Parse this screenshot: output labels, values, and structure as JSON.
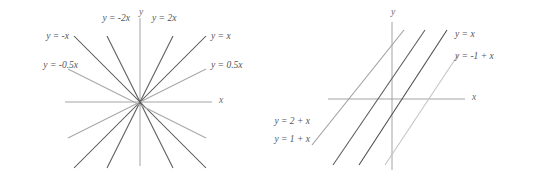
{
  "figure": {
    "background_color": "#ffffff",
    "width": 535,
    "height": 177
  },
  "chart_data": [
    {
      "type": "line",
      "title": "",
      "subtitle": "",
      "xlabel": "x",
      "ylabel": "y",
      "grid": false,
      "legend_position": "inline-annotations",
      "axis_color": "#9a9a9a",
      "origin": {
        "x": 140,
        "y": 102
      },
      "scale": {
        "x_units_per_px": 1,
        "y_units_per_px": 1
      },
      "xlim": [
        -75,
        72
      ],
      "ylim": [
        -66,
        84
      ],
      "axes": {
        "x_axis": {
          "x1": 65,
          "y1": 102,
          "x2": 212,
          "y2": 102
        },
        "y_axis": {
          "x1": 140,
          "y1": 18,
          "x2": 140,
          "y2": 166
        }
      },
      "axis_label_positions": {
        "x": {
          "x": 219,
          "y": 101
        },
        "y": {
          "x": 141,
          "y": 13
        }
      },
      "series": [
        {
          "name": "y = 2x",
          "label": "y = 2x",
          "slope": 2,
          "intercept": 0,
          "color": "#5f5f5f",
          "x1": 107,
          "y1": 168,
          "x2": 173,
          "y2": 36,
          "label_x": 152,
          "label_y": 19,
          "label_anchor": "start"
        },
        {
          "name": "y = x",
          "label": "y = x",
          "slope": 1,
          "intercept": 0,
          "color": "#4f4f4f",
          "x1": 74,
          "y1": 168,
          "x2": 206,
          "y2": 36,
          "label_x": 211,
          "label_y": 37,
          "label_anchor": "start"
        },
        {
          "name": "y = 0.5x",
          "label": "y = 0.5x",
          "slope": 0.5,
          "intercept": 0,
          "color": "#a8a8a8",
          "x1": 68,
          "y1": 138,
          "x2": 206,
          "y2": 69,
          "label_x": 211,
          "label_y": 66,
          "label_anchor": "start"
        },
        {
          "name": "y = -2x",
          "label": "y = -2x",
          "slope": -2,
          "intercept": 0,
          "color": "#5f5f5f",
          "x1": 107,
          "y1": 36,
          "x2": 173,
          "y2": 168,
          "label_x": 130,
          "label_y": 19,
          "label_anchor": "end"
        },
        {
          "name": "y = -x",
          "label": "y = -x",
          "slope": -1,
          "intercept": 0,
          "color": "#4f4f4f",
          "x1": 74,
          "y1": 36,
          "x2": 206,
          "y2": 168,
          "label_x": 69,
          "label_y": 37,
          "label_anchor": "end"
        },
        {
          "name": "y = -0.5x",
          "label": "y = -0.5x",
          "slope": -0.5,
          "intercept": 0,
          "color": "#a8a8a8",
          "x1": 68,
          "y1": 69,
          "x2": 206,
          "y2": 138,
          "label_x": 78,
          "label_y": 66,
          "label_anchor": "end"
        }
      ]
    },
    {
      "type": "line",
      "title": "",
      "subtitle": "",
      "xlabel": "x",
      "ylabel": "y",
      "grid": false,
      "legend_position": "inline-annotations",
      "axis_color": "#9a9a9a",
      "origin": {
        "x": 392,
        "y": 99
      },
      "scale": {
        "x_units_per_px": 1,
        "y_units_per_px": 1
      },
      "xlim": [
        -64,
        73
      ],
      "ylim": [
        -71,
        77
      ],
      "axes": {
        "x_axis": {
          "x1": 328,
          "y1": 99,
          "x2": 465,
          "y2": 99
        },
        "y_axis": {
          "x1": 392,
          "y1": 22,
          "x2": 392,
          "y2": 170
        }
      },
      "axis_label_positions": {
        "x": {
          "x": 472,
          "y": 98
        },
        "y": {
          "x": 393,
          "y": 13
        }
      },
      "series": [
        {
          "name": "y = 2 + x",
          "label": "y = 2 + x",
          "slope": 1,
          "intercept": 2,
          "color": "#9d9d9d",
          "x1": 312,
          "y1": 145,
          "x2": 404,
          "y2": 30,
          "label_x": 310,
          "label_y": 122,
          "label_anchor": "end"
        },
        {
          "name": "y = 1 + x",
          "label": "y = 1 + x",
          "slope": 1,
          "intercept": 1,
          "color": "#5a5a5a",
          "x1": 333,
          "y1": 165,
          "x2": 425,
          "y2": 30,
          "label_x": 310,
          "label_y": 140,
          "label_anchor": "end"
        },
        {
          "name": "y = x",
          "label": "y = x",
          "slope": 1,
          "intercept": 0,
          "color": "#4a4a4a",
          "x1": 359,
          "y1": 165,
          "x2": 447,
          "y2": 30,
          "label_x": 455,
          "label_y": 35,
          "label_anchor": "start"
        },
        {
          "name": "y = -1 + x",
          "label": "y = -1 + x",
          "slope": 1,
          "intercept": -1,
          "color": "#c2c2c2",
          "x1": 385,
          "y1": 165,
          "x2": 458,
          "y2": 55,
          "label_x": 455,
          "label_y": 57,
          "label_anchor": "start"
        }
      ]
    }
  ]
}
